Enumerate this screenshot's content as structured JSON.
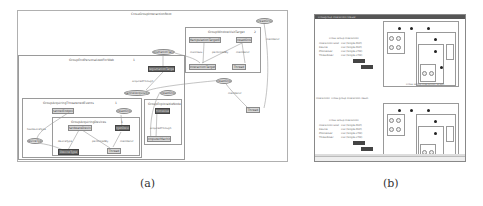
{
  "figure": {
    "panel_a": {
      "caption": "(a)",
      "outer_group": {
        "label": "CrossGroupInteractionRoot"
      },
      "groups": [
        {
          "id": "g1",
          "label": "GroupWindowVisitTarget",
          "number": "2"
        },
        {
          "id": "g2",
          "label": "GroupEndPersonalizedForWeb",
          "number": "1"
        },
        {
          "id": "g3",
          "label": "GroupAcquiringThreatenedEvents",
          "number": "1"
        },
        {
          "id": "g4",
          "label": "GroupAcquiringDevices",
          "number": "1"
        },
        {
          "id": "g5",
          "label": "GroupExplorableNode",
          "number": ""
        }
      ],
      "nodes": [
        {
          "id": "n1",
          "label": "ThreadGroup",
          "shape": "ellipse"
        },
        {
          "id": "n2",
          "label": "ToolManipulationTargetEvent",
          "shape": "rect"
        },
        {
          "id": "n3",
          "label": "ThreadGroup",
          "shape": "rect"
        },
        {
          "id": "n4",
          "label": "InteractionTarget",
          "shape": "rect"
        },
        {
          "id": "n5",
          "label": "Thread",
          "shape": "rect"
        },
        {
          "id": "n6",
          "label": "RegistrationTarget",
          "shape": "ellipse"
        },
        {
          "id": "n7",
          "label": "RegistrationTarget",
          "shape": "rect",
          "dark": true
        },
        {
          "id": "n8",
          "label": "ThreadGroup",
          "shape": "ellipse"
        },
        {
          "id": "n9",
          "label": "ChannelAcquisition",
          "shape": "ellipse"
        },
        {
          "id": "n10",
          "label": "ThreadGroup",
          "shape": "ellipse"
        },
        {
          "id": "n11",
          "label": "Thread",
          "shape": "rect"
        },
        {
          "id": "n12",
          "label": "ChannelEndpoint",
          "shape": "rect"
        },
        {
          "id": "n13",
          "label": "ThreadGroup",
          "shape": "ellipse"
        },
        {
          "id": "n14",
          "label": "PhoneUser",
          "shape": "rect",
          "dark": true
        },
        {
          "id": "n15",
          "label": "DeviceType",
          "shape": "ellipse"
        },
        {
          "id": "n16",
          "label": "HardwareDevice",
          "shape": "rect"
        },
        {
          "id": "n17",
          "label": "TargetDevice",
          "shape": "rect",
          "dark": true
        },
        {
          "id": "n18",
          "label": "ComputerMachine",
          "shape": "rect"
        },
        {
          "id": "n19",
          "label": "DeviceType",
          "shape": "rect",
          "dark": true
        },
        {
          "id": "n20",
          "label": "Thread",
          "shape": "rect"
        }
      ],
      "edge_labels": [
        "manifests",
        "performedBy",
        "memberOf",
        "memberOf",
        "acquiredThrough",
        "memberOf",
        "hasDeviceType",
        "deviceType",
        "performedBy",
        "memberOf",
        "acquiredThrough"
      ]
    },
    "panel_b": {
      "caption": "(b)",
      "window": {
        "title": "Crossgroup Interaction Viewer",
        "sections": [
          {
            "form_title": "Cross Group Interaction",
            "rows": [
              {
                "label": "Interaction Goal",
                "value": "CGI (Single-PDP)"
              },
              {
                "label": "Device",
                "value": "CGI (Single-PDP)"
              },
              {
                "label": "PhoneUser",
                "value": "CGI (Single-CTM)"
              },
              {
                "label": "ThreadUser",
                "value": "CGI (Single-CTM)"
              }
            ],
            "buttons": [
              "Create",
              "Create"
            ],
            "graph_caption": "Cross Group Interaction Graph"
          },
          {
            "form_title": "Cross Group Interaction",
            "rows": [
              {
                "label": "Interaction Goal",
                "value": "CGI (Single-PDP)"
              },
              {
                "label": "Device",
                "value": "CGI (Single-PDP)"
              },
              {
                "label": "PhoneUser",
                "value": "CGI (Single-CTM)"
              },
              {
                "label": "ThreadUser",
                "value": "CGI (Single-CTM)"
              }
            ],
            "buttons": [
              "Create",
              "Create"
            ],
            "graph_caption": ""
          }
        ],
        "middle_text": "Interaction: Cross group interaction result"
      }
    }
  }
}
